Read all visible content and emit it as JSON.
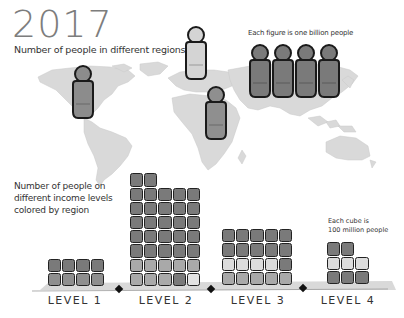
{
  "chart_data": {
    "type": "pictogram",
    "title": "2017",
    "subtitle": "Number of people in different regions",
    "map_section": {
      "unit_note": "Each figure is one billion people",
      "regions": [
        {
          "name": "Americas",
          "figures": 1,
          "color": "#8c8c8c"
        },
        {
          "name": "Europe",
          "figures": 1,
          "color": "#d4d4d4"
        },
        {
          "name": "Africa",
          "figures": 1,
          "color": "#8f8f8f"
        },
        {
          "name": "Asia",
          "figures": 4,
          "color": "#7a7a7a"
        }
      ]
    },
    "income_section": {
      "description": "Number of people on different income levels colored by region",
      "unit_note": "Each cube is 100 million people",
      "categories": [
        "LEVEL 1",
        "LEVEL 2",
        "LEVEL 3",
        "LEVEL 4"
      ],
      "values": [
        8,
        37,
        20,
        8
      ],
      "unit": "cubes (100 million people each)"
    }
  },
  "header": {
    "year": "2017",
    "subtitle": "Number of people in different regions",
    "figure_note": "Each figure is one billion people"
  },
  "income": {
    "line1": "Number of people on",
    "line2": "different income levels",
    "line3": "colored by region",
    "cube_note_1": "Each cube is",
    "cube_note_2": "100 million people"
  },
  "levels": [
    {
      "label": "LEVEL 1"
    },
    {
      "label": "LEVEL 2"
    },
    {
      "label": "LEVEL 3"
    },
    {
      "label": "LEVEL 4"
    }
  ],
  "colors": {
    "map": "#d9d9d9",
    "asia": "#7a7a7a",
    "africa": "#8f8f8f",
    "americas": "#8c8c8c",
    "europe": "#d4d4d4",
    "floor": "#d6d6d6",
    "outline": "#1a1a1a"
  }
}
